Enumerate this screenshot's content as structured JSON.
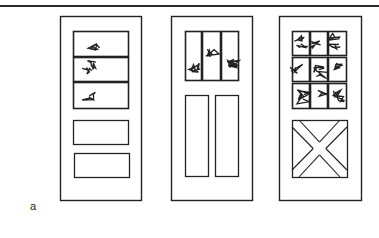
{
  "figure": {
    "label": "a",
    "stroke_color": "#222222",
    "doors": [
      {
        "name": "door-three-horizontal-lites",
        "frame": {
          "x": 60,
          "y": 16,
          "w": 81,
          "h": 184
        },
        "glass_panes": [
          {
            "x": 73,
            "y": 31,
            "w": 55,
            "h": 25
          },
          {
            "x": 73,
            "y": 57,
            "w": 55,
            "h": 24
          },
          {
            "x": 73,
            "y": 82,
            "w": 55,
            "h": 26
          }
        ],
        "panels": [
          {
            "x": 73,
            "y": 120,
            "w": 55,
            "h": 24
          },
          {
            "x": 74,
            "y": 153,
            "w": 55,
            "h": 24
          }
        ]
      },
      {
        "name": "door-three-vertical-lites",
        "frame": {
          "x": 171,
          "y": 16,
          "w": 81,
          "h": 184
        },
        "glass_panes": [
          {
            "x": 185,
            "y": 31,
            "w": 16,
            "h": 49
          },
          {
            "x": 202,
            "y": 31,
            "w": 18,
            "h": 49
          },
          {
            "x": 221,
            "y": 31,
            "w": 17,
            "h": 49
          }
        ],
        "panels": [
          {
            "x": 185,
            "y": 95,
            "w": 23,
            "h": 81
          },
          {
            "x": 215,
            "y": 95,
            "w": 23,
            "h": 81
          }
        ]
      },
      {
        "name": "door-nine-lite-crossbuck",
        "frame": {
          "x": 279,
          "y": 16,
          "w": 82,
          "h": 184
        },
        "glass_panes": [
          {
            "x": 292,
            "y": 31,
            "w": 17,
            "h": 24
          },
          {
            "x": 310,
            "y": 31,
            "w": 17,
            "h": 24
          },
          {
            "x": 328,
            "y": 31,
            "w": 18,
            "h": 24
          },
          {
            "x": 292,
            "y": 57,
            "w": 17,
            "h": 24
          },
          {
            "x": 310,
            "y": 57,
            "w": 17,
            "h": 24
          },
          {
            "x": 328,
            "y": 57,
            "w": 18,
            "h": 24
          },
          {
            "x": 292,
            "y": 83,
            "w": 17,
            "h": 25
          },
          {
            "x": 310,
            "y": 83,
            "w": 17,
            "h": 25
          },
          {
            "x": 328,
            "y": 83,
            "w": 18,
            "h": 25
          }
        ],
        "crossbuck_panel": {
          "x": 292,
          "y": 120,
          "w": 55,
          "h": 57
        }
      }
    ]
  }
}
